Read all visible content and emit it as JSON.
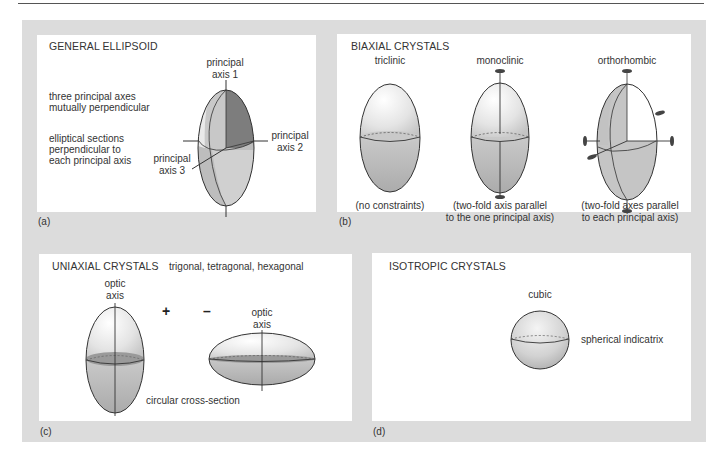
{
  "panels": {
    "a": {
      "tag": "(a)",
      "title": "GENERAL ELLIPSOID",
      "notes": [
        "three principal axes",
        "mutually perpendicular",
        "elliptical sections",
        "perpendicular to",
        "each principal axis"
      ],
      "axis1": [
        "principal",
        "axis 1"
      ],
      "axis2": [
        "principal",
        "axis 2"
      ],
      "axis3": [
        "principal",
        "axis 3"
      ]
    },
    "b": {
      "tag": "(b)",
      "title": "BIAXIAL CRYSTALS",
      "systems": [
        {
          "name": "triclinic",
          "caption": [
            "(no constraints)"
          ]
        },
        {
          "name": "monoclinic",
          "caption": [
            "(two-fold axis parallel",
            "to the one principal axis)"
          ]
        },
        {
          "name": "orthorhombic",
          "caption": [
            "(two-fold axes parallel",
            "to each principal axis)"
          ]
        }
      ]
    },
    "c": {
      "tag": "(c)",
      "title": "UNIAXIAL CRYSTALS",
      "subtitle": "trigonal, tetragonal, hexagonal",
      "positive_sign": "+",
      "negative_sign": "–",
      "optic_axis_left": [
        "optic",
        "axis"
      ],
      "optic_axis_right": [
        "optic",
        "axis"
      ],
      "cross_section": "circular cross-section"
    },
    "d": {
      "tag": "(d)",
      "title": "ISOTROPIC CRYSTALS",
      "system": "cubic",
      "caption": "spherical indicatrix"
    }
  },
  "colors": {
    "frame": "#dcdcdc",
    "shade_dark": "#7a7a7a",
    "shade_mid": "#b5b5b5",
    "shade_light": "#e8e8e8",
    "outline": "#333333"
  }
}
